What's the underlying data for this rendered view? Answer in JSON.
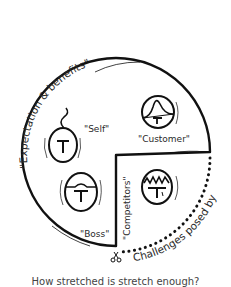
{
  "diagram": {
    "arc_label_top": "\"Expectation & benefits\"",
    "arc_label_bottom": "Challenges posed by",
    "wedge_label": "\"Competitors\"",
    "nodes": [
      {
        "id": "self",
        "label": "\"Self\"",
        "icon": "t-in-oval-with-curl-icon"
      },
      {
        "id": "customer",
        "label": "\"Customer\"",
        "icon": "t-in-oval-with-peak-icon"
      },
      {
        "id": "boss",
        "label": "\"Boss\"",
        "icon": "t-in-oval-with-bump-icon"
      },
      {
        "id": "competitors",
        "label": "",
        "icon": "t-in-oval-with-zigzag-icon"
      }
    ],
    "caption": "How stretched is stretch enough?",
    "colors": {
      "ink": "#111111",
      "background": "#ffffff"
    }
  }
}
